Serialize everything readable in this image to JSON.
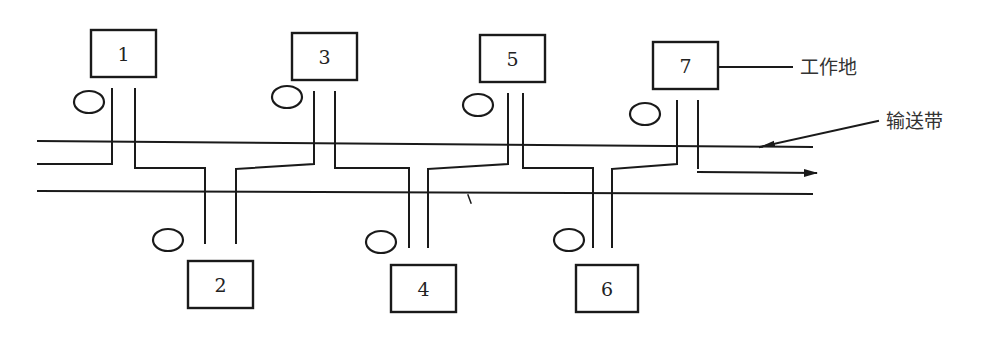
{
  "diagram": {
    "type": "production-line-layout",
    "labels": {
      "workplace": "工作地",
      "conveyor": "输送带"
    },
    "colors": {
      "line": "#1a1a1a",
      "text": "#222222",
      "background": "#ffffff"
    },
    "conveyor": {
      "top_rail_y": 141,
      "bottom_rail_y": 191,
      "x_start": 38,
      "x_end": 812,
      "flow_direction": "right",
      "flow_arrow_y": 172
    },
    "stations": [
      {
        "id": "1",
        "label": "1",
        "side": "top",
        "box": {
          "x": 91,
          "y": 30,
          "w": 65,
          "h": 47
        },
        "worker": {
          "cx": 89,
          "cy": 102
        },
        "legs_x": [
          112,
          135
        ]
      },
      {
        "id": "2",
        "label": "2",
        "side": "bottom",
        "box": {
          "x": 188,
          "y": 261,
          "w": 65,
          "h": 47
        },
        "worker": {
          "cx": 168,
          "cy": 240
        },
        "legs_x": [
          205,
          236
        ]
      },
      {
        "id": "3",
        "label": "3",
        "side": "top",
        "box": {
          "x": 292,
          "y": 33,
          "w": 65,
          "h": 47
        },
        "worker": {
          "cx": 287,
          "cy": 97
        },
        "legs_x": [
          314,
          335
        ]
      },
      {
        "id": "4",
        "label": "4",
        "side": "bottom",
        "box": {
          "x": 391,
          "y": 265,
          "w": 65,
          "h": 47
        },
        "worker": {
          "cx": 381,
          "cy": 242
        },
        "legs_x": [
          409,
          428
        ]
      },
      {
        "id": "5",
        "label": "5",
        "side": "top",
        "box": {
          "x": 480,
          "y": 35,
          "w": 65,
          "h": 47
        },
        "worker": {
          "cx": 478,
          "cy": 105
        },
        "legs_x": [
          508,
          523
        ]
      },
      {
        "id": "6",
        "label": "6",
        "side": "bottom",
        "box": {
          "x": 576,
          "y": 265,
          "w": 62,
          "h": 47
        },
        "worker": {
          "cx": 569,
          "cy": 240
        },
        "legs_x": [
          593,
          612
        ]
      },
      {
        "id": "7",
        "label": "7",
        "side": "top",
        "box": {
          "x": 653,
          "y": 42,
          "w": 65,
          "h": 47
        },
        "worker": {
          "cx": 645,
          "cy": 114
        },
        "legs_x": [
          677,
          698
        ]
      }
    ],
    "callouts": [
      {
        "target": "7",
        "text_key": "workplace",
        "text_x": 800,
        "text_y": 74
      },
      {
        "target": "conveyor",
        "text_key": "conveyor",
        "text_x": 887,
        "text_y": 128
      }
    ]
  }
}
